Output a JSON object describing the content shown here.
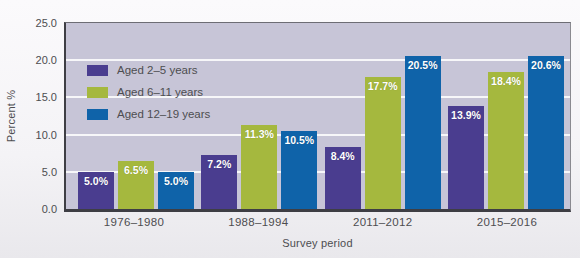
{
  "chart_data": {
    "type": "bar",
    "title": "",
    "xlabel": "Survey period",
    "ylabel": "Percent %",
    "ylim": [
      0,
      25
    ],
    "yticks": [
      0,
      5,
      10,
      15,
      20,
      25
    ],
    "ytick_labels": [
      "0.0",
      "5.0",
      "10.0",
      "15.0",
      "20.0",
      "25.0"
    ],
    "gridlines_at": [
      5,
      10,
      15,
      20
    ],
    "grid": true,
    "legend_position": "top-left inside plot",
    "categories": [
      "1976–1980",
      "1988–1994",
      "2011–2012",
      "2015–2016"
    ],
    "series": [
      {
        "name": "Aged 2–5 years",
        "color": "#4a3d8f",
        "values": [
          5.0,
          7.2,
          8.4,
          13.9
        ],
        "labels": [
          "5.0%",
          "7.2%",
          "8.4%",
          "13.9%"
        ]
      },
      {
        "name": "Aged 6–11 years",
        "color": "#a5b83e",
        "values": [
          6.5,
          11.3,
          17.7,
          18.4
        ],
        "labels": [
          "6.5%",
          "11.3%",
          "17.7%",
          "18.4%"
        ]
      },
      {
        "name": "Aged 12–19 years",
        "color": "#0f63a9",
        "values": [
          5.0,
          10.5,
          20.5,
          20.6
        ],
        "labels": [
          "5.0%",
          "10.5%",
          "20.5%",
          "20.6%"
        ]
      }
    ]
  },
  "style": {
    "plot_bg": "#c7c5d7",
    "gridline_color": "rgba(255,255,255,0.85)",
    "text_color": "#4d4d50",
    "axis_color": "#3e3e44"
  }
}
